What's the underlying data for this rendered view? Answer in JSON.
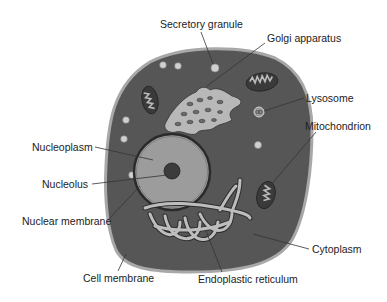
{
  "diagram": {
    "type": "labeled-illustration",
    "colors": {
      "cytoplasm": "#555555",
      "cell_membrane": "#a8a8a8",
      "nucleoplasm": "#9a9a9a",
      "nucleolus": "#3c3c3c",
      "organelle_light": "#c8c8c8",
      "leader_line": "#333333",
      "text": "#222222"
    },
    "labels": {
      "secretory_granule": "Secretory granule",
      "golgi_apparatus": "Golgi apparatus",
      "lysosome": "Lysosome",
      "mitochondrion": "Mitochondrion",
      "nucleoplasm": "Nucleoplasm",
      "nucleolus": "Nucleolus",
      "nuclear_membrane": "Nuclear membrane",
      "cytoplasm": "Cytoplasm",
      "cell_membrane": "Cell membrane",
      "endoplastic_reticulum": "Endoplastic reticulum"
    }
  }
}
